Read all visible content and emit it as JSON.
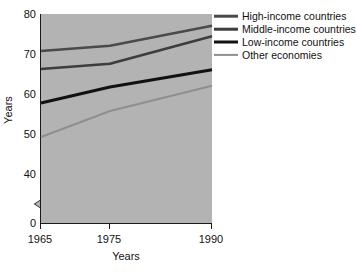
{
  "chart_data": {
    "type": "line",
    "title": "",
    "subtitle": "",
    "xlabel": "Years",
    "ylabel": "Years",
    "x": [
      1965,
      1975,
      1990
    ],
    "xticks": [
      "1965",
      "1975",
      "1990"
    ],
    "xlim": [
      1965,
      1990
    ],
    "yticks": [
      "0",
      "40",
      "50",
      "60",
      "70",
      "80"
    ],
    "ylim": [
      40,
      80
    ],
    "y_axis_break": true,
    "y_axis_break_note": "axis broken between 0 and 40",
    "grid": false,
    "legend_position": "top-right",
    "plot_background": "#b3b3b3",
    "series": [
      {
        "name": "High-income countries",
        "color": "#4a4a4a",
        "values": [
          71.0,
          72.3,
          77.3
        ]
      },
      {
        "name": "Middle-income countries",
        "color": "#3d3d3d",
        "values": [
          66.5,
          67.8,
          74.7
        ]
      },
      {
        "name": "Low-income countries",
        "color": "#111111",
        "values": [
          58.0,
          62.0,
          66.3
        ]
      },
      {
        "name": "Other economies",
        "color": "#8f8f8f",
        "values": [
          49.5,
          56.0,
          62.3
        ]
      }
    ]
  },
  "axes": {
    "y_tick_values": [
      80,
      70,
      60,
      50,
      40,
      0
    ],
    "y_tick_labels": [
      "80",
      "70",
      "60",
      "50",
      "40",
      "0"
    ],
    "x_tick_values": [
      1965,
      1975,
      1990
    ],
    "x_tick_labels": [
      "1965",
      "1975",
      "1990"
    ],
    "x_axis_title": "Years",
    "y_axis_title": "Years"
  },
  "legend": {
    "items": [
      {
        "label": "High-income countries",
        "color": "#4a4a4a",
        "width": 2.6
      },
      {
        "label": "Middle-income countries",
        "color": "#3d3d3d",
        "width": 2.6
      },
      {
        "label": "Low-income countries",
        "color": "#111111",
        "width": 3.0
      },
      {
        "label": "Other economies",
        "color": "#8f8f8f",
        "width": 2.2
      }
    ]
  }
}
